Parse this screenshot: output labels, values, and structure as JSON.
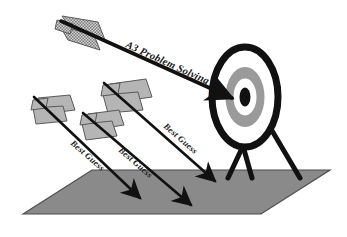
{
  "diagram": {
    "canvas": {
      "width": 347,
      "height": 237,
      "background": "#ffffff"
    },
    "colors": {
      "ink": "#1a1a1a",
      "outline": "#000000",
      "ground_fill": "#8a8a8a",
      "ground_stroke": "#4d4d4d",
      "fletching_fill": "#b5b5b5",
      "fletching_stroke": "#5a5a5a",
      "target_ring_gray": "#9a9a9a",
      "target_ring_white": "#ffffff",
      "target_ring_black": "#111111"
    },
    "ground": {
      "name": "ground-plane",
      "shape": "parallelogram",
      "points": "23,214 92,170 330,170 261,214"
    },
    "target": {
      "name": "archery-target",
      "center_x": 245,
      "center_y": 97,
      "rings": [
        {
          "name": "outer-black-ring",
          "rx": 35,
          "ry": 52,
          "fill": "#ffffff",
          "stroke": "#111111",
          "stroke_width": 7
        },
        {
          "name": "mid-gray-ring",
          "rx": 20,
          "ry": 31,
          "fill": "#9a9a9a",
          "stroke": "#9a9a9a",
          "stroke_width": 1
        },
        {
          "name": "inner-white-ring",
          "rx": 12,
          "ry": 19,
          "fill": "#ffffff",
          "stroke": "#ffffff",
          "stroke_width": 1
        },
        {
          "name": "bullseye",
          "rx": 6,
          "ry": 10,
          "fill": "#111111",
          "stroke": "#111111",
          "stroke_width": 1
        }
      ],
      "legs": [
        {
          "name": "target-leg-left",
          "path": "M 243,148 L 228,178"
        },
        {
          "name": "target-leg-center",
          "path": "M 243,148 L 251,178"
        },
        {
          "name": "target-leg-right",
          "path": "M 258,107 L 300,178"
        }
      ]
    },
    "arrows": [
      {
        "name": "arrow-a3-problem-solving",
        "label": "A3 Problem Solving",
        "label_class": "label-main",
        "label_x": 125,
        "label_y": 47,
        "label_rotate": 29,
        "fletching_style": "checkered",
        "shaft": "M 73,27 L 233,98",
        "tail_x": 73,
        "tail_y": 27,
        "hits_target": true
      },
      {
        "name": "arrow-best-guess-right",
        "label": "Best Guess",
        "label_class": "label-guess",
        "label_x": 166,
        "label_y": 122,
        "label_rotate": 41,
        "fletching_style": "plain",
        "shaft": "M 119,88 L 216,180",
        "tail_x": 119,
        "tail_y": 88,
        "hits_target": false
      },
      {
        "name": "arrow-best-guess-middle",
        "label": "Best Guess",
        "label_class": "label-guess",
        "label_x": 121,
        "label_y": 146,
        "label_rotate": 41,
        "fletching_style": "plain",
        "shaft": "M 93,117 L 192,203",
        "tail_x": 93,
        "tail_y": 117,
        "hits_target": false
      },
      {
        "name": "arrow-best-guess-left",
        "label": "Best Guess",
        "label_class": "label-guess",
        "label_x": 76,
        "label_y": 139,
        "label_rotate": 41,
        "fletching_style": "plain",
        "shaft": "M 36,100 L 139,196",
        "tail_x": 36,
        "tail_y": 100,
        "hits_target": false
      }
    ]
  }
}
